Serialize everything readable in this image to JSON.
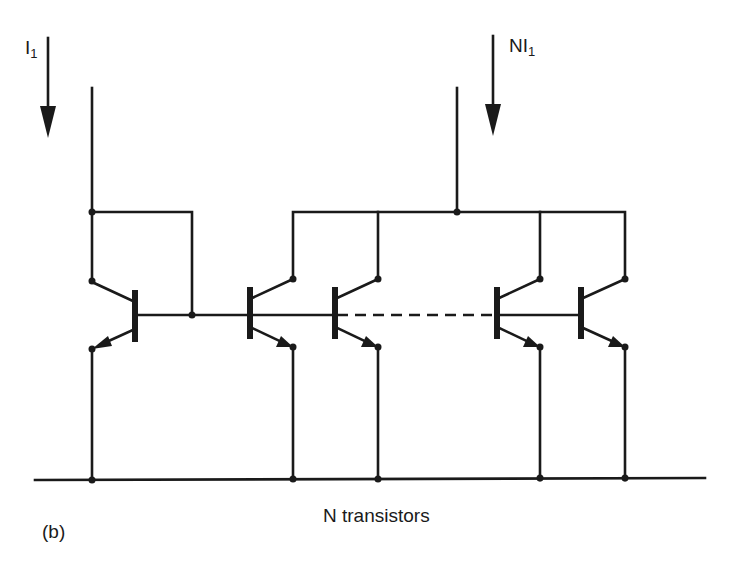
{
  "figure": {
    "panel_label": "(b)",
    "caption": "N transistors",
    "input_current": {
      "label": "I",
      "subscript": "1"
    },
    "output_current": {
      "label": "NI",
      "subscript": "1"
    }
  },
  "circuit": {
    "type": "BJT current mirror with N output transistors",
    "stroke_color": "#1a1a1a",
    "transistors": [
      {
        "id": "Q_ref",
        "role": "reference (diode-connected)",
        "orientation": "mirrored"
      },
      {
        "id": "Q1",
        "role": "output"
      },
      {
        "id": "Q2",
        "role": "output"
      },
      {
        "id": "QN-1",
        "role": "output"
      },
      {
        "id": "QN",
        "role": "output"
      }
    ],
    "ellipsis": "dashed base line between Q2 and QN-1"
  }
}
